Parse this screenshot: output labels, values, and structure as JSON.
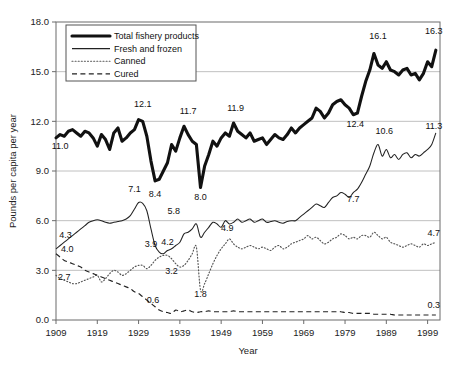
{
  "figure": {
    "axis_titles": {
      "x": "Year",
      "y": "Pounds per capita per year"
    },
    "y_ticks": [
      "0.0",
      "3.0",
      "6.0",
      "9.0",
      "12.0",
      "15.0",
      "18.0"
    ],
    "x_ticks": [
      "1909",
      "1919",
      "1929",
      "1939",
      "1949",
      "1959",
      "1969",
      "1979",
      "1989",
      "1999"
    ],
    "legend": {
      "items": [
        {
          "label": "Total fishery products",
          "style": "thick-solid"
        },
        {
          "label": "Fresh and frozen",
          "style": "thin-solid"
        },
        {
          "label": "Canned",
          "style": "dotted"
        },
        {
          "label": "Cured",
          "style": "dashed"
        }
      ]
    },
    "annotations": [
      {
        "text": "11.0",
        "x": 1910,
        "y": 10.3,
        "anchor": "middle"
      },
      {
        "text": "12.1",
        "x": 1930,
        "y": 12.85,
        "anchor": "middle"
      },
      {
        "text": "8.4",
        "x": 1933,
        "y": 7.45,
        "anchor": "middle"
      },
      {
        "text": "11.7",
        "x": 1941,
        "y": 12.45,
        "anchor": "middle"
      },
      {
        "text": "8.0",
        "x": 1944,
        "y": 7.25,
        "anchor": "middle"
      },
      {
        "text": "11.9",
        "x": 1952.5,
        "y": 12.6,
        "anchor": "middle"
      },
      {
        "text": "12.4",
        "x": 1981.5,
        "y": 11.65,
        "anchor": "middle"
      },
      {
        "text": "16.1",
        "x": 1987,
        "y": 16.95,
        "anchor": "middle"
      },
      {
        "text": "16.3",
        "x": 2000.5,
        "y": 17.3,
        "anchor": "middle"
      },
      {
        "text": "4.3",
        "x": 1909.8,
        "y": 4.95,
        "anchor": "start"
      },
      {
        "text": "7.1",
        "x": 1928,
        "y": 7.72,
        "anchor": "middle"
      },
      {
        "text": "5.8",
        "x": 1937.5,
        "y": 6.4,
        "anchor": "middle"
      },
      {
        "text": "4.2",
        "x": 1936,
        "y": 4.52,
        "anchor": "middle"
      },
      {
        "text": "7.7",
        "x": 1981,
        "y": 7.1,
        "anchor": "middle"
      },
      {
        "text": "10.6",
        "x": 1988.5,
        "y": 11.25,
        "anchor": "middle"
      },
      {
        "text": "11.3",
        "x": 2000.5,
        "y": 11.55,
        "anchor": "middle"
      },
      {
        "text": "2.7",
        "x": 1909.5,
        "y": 2.42,
        "anchor": "start"
      },
      {
        "text": "3.9",
        "x": 1932,
        "y": 4.4,
        "anchor": "middle"
      },
      {
        "text": "3.2",
        "x": 1937,
        "y": 2.75,
        "anchor": "middle"
      },
      {
        "text": "1.8",
        "x": 1944,
        "y": 1.4,
        "anchor": "middle"
      },
      {
        "text": "4.9",
        "x": 1950.5,
        "y": 5.35,
        "anchor": "middle"
      },
      {
        "text": "4.7",
        "x": 2000.5,
        "y": 5.05,
        "anchor": "middle"
      },
      {
        "text": "4.0",
        "x": 1910.2,
        "y": 4.1,
        "anchor": "start"
      },
      {
        "text": "0.6",
        "x": 1932.5,
        "y": 1.05,
        "anchor": "middle"
      },
      {
        "text": "0.3",
        "x": 2000.5,
        "y": 0.72,
        "anchor": "middle"
      }
    ]
  },
  "chart_data": {
    "type": "line",
    "title": "",
    "xlabel": "Year",
    "ylabel": "Pounds per capita per year",
    "xlim": [
      1909,
      2002
    ],
    "ylim": [
      0,
      18
    ],
    "grid": "horizontal",
    "legend_position": "top-left",
    "x": [
      1909,
      1910,
      1911,
      1912,
      1913,
      1914,
      1915,
      1916,
      1917,
      1918,
      1919,
      1920,
      1921,
      1922,
      1923,
      1924,
      1925,
      1926,
      1927,
      1928,
      1929,
      1930,
      1931,
      1932,
      1933,
      1934,
      1935,
      1936,
      1937,
      1938,
      1939,
      1940,
      1941,
      1942,
      1943,
      1944,
      1945,
      1946,
      1947,
      1948,
      1949,
      1950,
      1951,
      1952,
      1953,
      1954,
      1955,
      1956,
      1957,
      1958,
      1959,
      1960,
      1961,
      1962,
      1963,
      1964,
      1965,
      1966,
      1967,
      1968,
      1969,
      1970,
      1971,
      1972,
      1973,
      1974,
      1975,
      1976,
      1977,
      1978,
      1979,
      1980,
      1981,
      1982,
      1983,
      1984,
      1985,
      1986,
      1987,
      1988,
      1989,
      1990,
      1991,
      1992,
      1993,
      1994,
      1995,
      1996,
      1997,
      1998,
      1999,
      2000,
      2001
    ],
    "series": [
      {
        "name": "Total fishery products",
        "style": "thick-solid",
        "values": [
          11.0,
          11.2,
          11.1,
          11.4,
          11.5,
          11.3,
          11.1,
          11.4,
          11.3,
          11.0,
          10.5,
          11.2,
          10.9,
          10.3,
          11.3,
          11.6,
          10.8,
          11.0,
          11.3,
          11.5,
          12.1,
          12.0,
          11.1,
          9.6,
          8.4,
          8.5,
          9.0,
          9.5,
          10.6,
          10.2,
          11.0,
          11.7,
          11.2,
          10.8,
          10.6,
          8.0,
          9.3,
          10.0,
          10.8,
          10.5,
          11.0,
          11.3,
          11.1,
          11.9,
          11.4,
          11.2,
          11.0,
          11.3,
          10.8,
          10.9,
          11.0,
          10.6,
          10.9,
          11.2,
          11.0,
          10.9,
          11.2,
          11.6,
          11.3,
          11.6,
          11.8,
          12.0,
          12.2,
          12.8,
          12.6,
          12.2,
          12.5,
          13.0,
          13.2,
          13.3,
          13.0,
          12.8,
          12.4,
          12.5,
          13.5,
          14.4,
          15.1,
          16.1,
          15.4,
          15.2,
          15.6,
          15.1,
          15.0,
          14.8,
          15.1,
          15.2,
          14.8,
          14.9,
          14.5,
          14.9,
          15.6,
          15.3,
          16.3
        ]
      },
      {
        "name": "Fresh and frozen",
        "style": "thin-solid",
        "values": [
          4.3,
          4.5,
          4.7,
          4.9,
          5.1,
          5.3,
          5.5,
          5.7,
          5.9,
          6.0,
          6.05,
          6.0,
          5.9,
          5.85,
          5.9,
          5.95,
          6.0,
          6.1,
          6.3,
          6.7,
          7.1,
          7.05,
          6.6,
          5.5,
          4.5,
          4.1,
          4.0,
          4.2,
          4.3,
          4.5,
          4.7,
          5.2,
          5.3,
          5.5,
          5.8,
          5.0,
          5.3,
          5.6,
          5.9,
          5.8,
          5.6,
          6.0,
          5.8,
          5.9,
          6.1,
          5.9,
          6.0,
          6.1,
          5.9,
          6.0,
          6.1,
          5.9,
          5.95,
          6.0,
          5.9,
          5.85,
          5.95,
          6.0,
          6.0,
          6.2,
          6.4,
          6.6,
          6.8,
          7.0,
          6.9,
          6.8,
          7.1,
          7.4,
          7.5,
          7.7,
          7.6,
          7.4,
          7.7,
          7.9,
          8.3,
          8.8,
          9.3,
          10.1,
          10.6,
          9.9,
          10.3,
          9.8,
          10.0,
          9.7,
          10.0,
          10.1,
          9.8,
          10.0,
          9.9,
          10.1,
          10.3,
          10.6,
          11.3
        ]
      },
      {
        "name": "Canned",
        "style": "dotted",
        "values": [
          2.7,
          2.5,
          2.4,
          2.3,
          2.2,
          2.2,
          2.3,
          2.4,
          2.5,
          2.6,
          2.7,
          2.3,
          2.5,
          2.8,
          3.0,
          2.9,
          2.7,
          2.8,
          3.0,
          3.2,
          3.3,
          3.3,
          3.1,
          3.3,
          3.6,
          3.8,
          3.9,
          3.9,
          3.7,
          3.4,
          3.2,
          3.3,
          3.6,
          4.0,
          4.4,
          1.8,
          2.2,
          2.8,
          3.4,
          3.9,
          4.3,
          4.6,
          4.9,
          4.6,
          4.4,
          4.3,
          4.4,
          4.5,
          4.4,
          4.3,
          4.4,
          4.3,
          4.2,
          4.4,
          4.5,
          4.3,
          4.4,
          4.6,
          4.7,
          4.8,
          4.9,
          5.1,
          4.9,
          5.0,
          4.8,
          4.6,
          4.7,
          4.9,
          5.0,
          5.2,
          5.1,
          4.9,
          5.0,
          4.9,
          5.1,
          5.1,
          5.0,
          5.3,
          5.1,
          4.9,
          5.0,
          4.7,
          4.6,
          4.5,
          4.4,
          4.5,
          4.6,
          4.5,
          4.4,
          4.6,
          4.5,
          4.6,
          4.7
        ]
      },
      {
        "name": "Cured",
        "style": "dashed",
        "values": [
          4.0,
          3.8,
          3.6,
          3.5,
          3.4,
          3.3,
          3.2,
          3.0,
          2.9,
          2.8,
          2.7,
          2.6,
          2.5,
          2.4,
          2.3,
          2.2,
          2.1,
          2.0,
          1.9,
          1.7,
          1.6,
          1.4,
          1.2,
          1.0,
          0.8,
          0.6,
          0.5,
          0.45,
          0.4,
          0.6,
          0.5,
          0.55,
          0.6,
          0.5,
          0.45,
          0.5,
          0.5,
          0.55,
          0.5,
          0.5,
          0.5,
          0.5,
          0.5,
          0.55,
          0.5,
          0.5,
          0.5,
          0.5,
          0.5,
          0.5,
          0.5,
          0.5,
          0.5,
          0.5,
          0.5,
          0.5,
          0.5,
          0.5,
          0.5,
          0.5,
          0.5,
          0.5,
          0.5,
          0.5,
          0.5,
          0.5,
          0.5,
          0.5,
          0.5,
          0.5,
          0.45,
          0.45,
          0.4,
          0.4,
          0.4,
          0.4,
          0.4,
          0.35,
          0.35,
          0.35,
          0.35,
          0.35,
          0.3,
          0.3,
          0.3,
          0.3,
          0.3,
          0.3,
          0.3,
          0.3,
          0.3,
          0.3,
          0.3
        ]
      }
    ]
  }
}
